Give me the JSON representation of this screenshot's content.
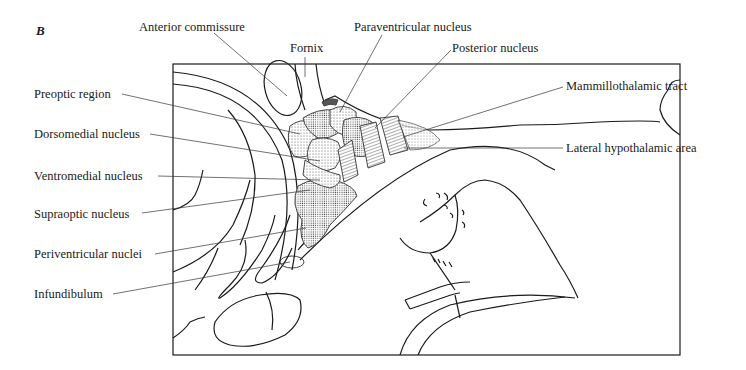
{
  "figure": {
    "panel_letter": "B",
    "labels": {
      "anterior_commissure": "Anterior commissure",
      "fornix": "Fornix",
      "paraventricular_nucleus": "Paraventricular nucleus",
      "posterior_nucleus": "Posterior nucleus",
      "preoptic_region": "Preoptic region",
      "dorsomedial_nucleus": "Dorsomedial nucleus",
      "ventromedial_nucleus": "Ventromedial nucleus",
      "supraoptic_nucleus": "Supraoptic nucleus",
      "periventricular_nuclei": "Periventricular nuclei",
      "infundibulum": "Infundibulum",
      "mammillothalamic_tract": "Mammillothalamic tract",
      "lateral_hypothalamic_area": "Lateral hypothalamic area"
    }
  }
}
